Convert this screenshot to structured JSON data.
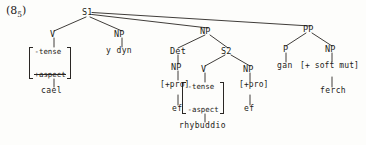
{
  "figure": {
    "example_number_base": "(8",
    "example_number_sub": "5",
    "example_number_close": ")",
    "type": "syntactic-tree",
    "language": "Welsh",
    "ink_color": "#2a2724",
    "background_color": "#fdfdfb"
  },
  "nodes": {
    "s1": "S1",
    "v_matrix": "V",
    "np_subject": "NP",
    "np_object": "NP",
    "pp": "PP",
    "det": "Det",
    "s2": "S2",
    "np_det_daughter": "NP",
    "v_embedded": "V",
    "np_embedded_object": "NP",
    "p": "P",
    "np_pp_complement": "NP"
  },
  "features": {
    "matrix_main_verb": {
      "row1": "-tense",
      "row2": "+aspect",
      "row2_struck": true
    },
    "matrix_embedded_verb": {
      "row1": "-tense",
      "row2": "-aspect"
    },
    "pro_det": "[+pro]",
    "pro_embedded": "[+pro]",
    "soft_mutation": "[+ soft mut]"
  },
  "terminals": {
    "main_verb": "cael",
    "subject": "y dyn",
    "det_pronoun": "ef",
    "embedded_verb": "rhybuddio",
    "embedded_object_pronoun": "ef",
    "preposition": "gan",
    "pp_noun": "ferch"
  }
}
